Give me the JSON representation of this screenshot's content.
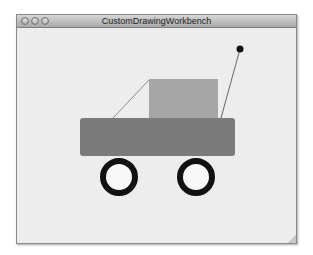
{
  "window": {
    "title": "CustomDrawingWorkbench",
    "controls": [
      "close",
      "minimize",
      "zoom"
    ]
  },
  "drawing": {
    "background": "#ededed",
    "body": {
      "x": 63,
      "y": 90,
      "w": 155,
      "h": 38,
      "color": "#7b7b7b",
      "radius": 3
    },
    "cabin": {
      "x": 132,
      "y": 51,
      "w": 69,
      "h": 39,
      "color": "#a6a6a6"
    },
    "windshield_line": {
      "x1": 132,
      "y1": 52,
      "x2": 96,
      "y2": 90,
      "color": "#8a8a8a"
    },
    "antenna_line": {
      "x1": 223,
      "y1": 21,
      "x2": 204,
      "y2": 90,
      "color": "#666666"
    },
    "antenna_ball": {
      "cx": 223,
      "cy": 21,
      "r": 3.5,
      "color": "#111111"
    },
    "wheels": [
      {
        "cx": 102,
        "cy": 149,
        "r": 16,
        "stroke": 6,
        "stroke_color": "#111111",
        "fill": "#f8f8f8"
      },
      {
        "cx": 179,
        "cy": 149,
        "r": 16,
        "stroke": 6,
        "stroke_color": "#111111",
        "fill": "#f8f8f8"
      }
    ]
  }
}
